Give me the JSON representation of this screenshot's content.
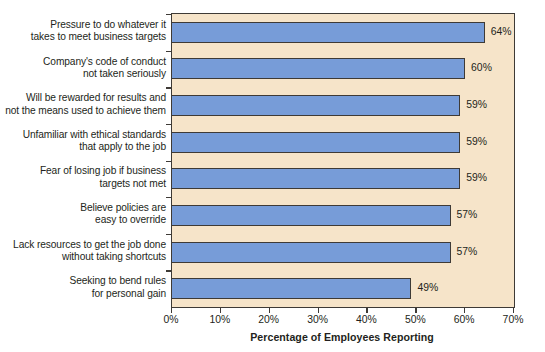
{
  "chart_data": {
    "type": "bar",
    "orientation": "horizontal",
    "title": "",
    "xlabel": "Percentage of Employees Reporting",
    "ylabel": "",
    "xlim": [
      0,
      70
    ],
    "xtick_labels": [
      "0%",
      "10%",
      "20%",
      "30%",
      "40%",
      "50%",
      "60%",
      "70%"
    ],
    "xtick_values": [
      0,
      10,
      20,
      30,
      40,
      50,
      60,
      70
    ],
    "grid": false,
    "legend": null,
    "categories": [
      "Pressure to do whatever it\ntakes to meet business targets",
      "Company's code of conduct\nnot taken seriously",
      "Will be rewarded for results and\nnot the means used to achieve them",
      "Unfamiliar with ethical standards\nthat apply to the job",
      "Fear of losing job if business\ntargets not met",
      "Believe policies are\neasy to override",
      "Lack resources to get the job done\nwithout taking shortcuts",
      "Seeking to bend rules\nfor personal gain"
    ],
    "values": [
      64,
      60,
      59,
      59,
      59,
      57,
      57,
      49
    ],
    "value_labels": [
      "64%",
      "60%",
      "59%",
      "59%",
      "59%",
      "57%",
      "57%",
      "49%"
    ],
    "colors": {
      "bar_fill": "#779cd8",
      "bar_stroke": "#3e3a36",
      "plot_background": "#f6e4c9",
      "axis": "#3e3a36",
      "text": "#231f20",
      "page_background": "#ffffff"
    }
  }
}
